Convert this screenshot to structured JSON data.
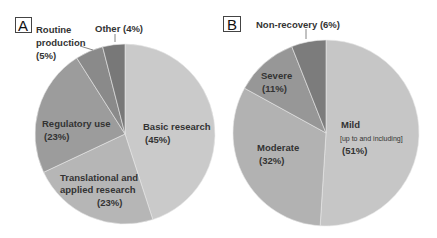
{
  "chart_data": [
    {
      "type": "pie",
      "panel": "A",
      "title": "",
      "categories": [
        "Basic research",
        "Translational and applied research",
        "Regulatory use",
        "Routine production",
        "Other"
      ],
      "values": [
        45,
        23,
        23,
        5,
        4
      ],
      "labels": [
        "Basic research (45%)",
        "Translational and applied research (23%)",
        "Regulatory use (23%)",
        "Routine production (5%)",
        "Other (4%)"
      ],
      "colors": [
        "#cacaca",
        "#b6b6b6",
        "#9c9c9c",
        "#8a8a8a",
        "#787878"
      ],
      "start_angle": "12 o'clock",
      "direction": "clockwise"
    },
    {
      "type": "pie",
      "panel": "B",
      "title": "",
      "categories": [
        "Mild [up to and including]",
        "Moderate",
        "Severe",
        "Non-recovery"
      ],
      "values": [
        51,
        32,
        11,
        6
      ],
      "labels": [
        "Mild [up to and including] (51%)",
        "Moderate (32%)",
        "Severe (11%)",
        "Non-recovery (6%)"
      ],
      "colors": [
        "#c6c6c6",
        "#b2b2b2",
        "#979797",
        "#7c7c7c"
      ],
      "start_angle": "12 o'clock",
      "direction": "clockwise"
    }
  ],
  "panels": {
    "a": {
      "letter": "A",
      "labels": {
        "basic_1": "Basic research",
        "basic_2": "(45%)",
        "trans_1": "Translational and",
        "trans_2": "applied research",
        "trans_3": "(23%)",
        "reg_1": "Regulatory use",
        "reg_2": "(23%)",
        "routine_1": "Routine",
        "routine_2": "production",
        "routine_3": "(5%)",
        "other": "Other (4%)"
      }
    },
    "b": {
      "letter": "B",
      "labels": {
        "mild_1": "Mild",
        "mild_2": "[up to and including]",
        "mild_3": "(51%)",
        "moderate_1": "Moderate",
        "moderate_2": "(32%)",
        "severe_1": "Severe",
        "severe_2": "(11%)",
        "nonrec": "Non-recovery (6%)"
      }
    }
  }
}
